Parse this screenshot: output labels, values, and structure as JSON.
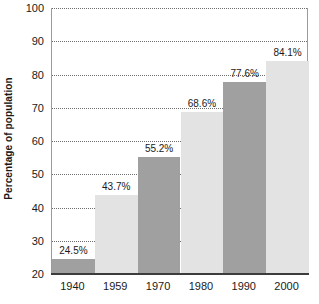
{
  "chart_data": {
    "type": "bar",
    "title": "",
    "subtitle": "",
    "xlabel": "",
    "ylabel": "Percentage of population",
    "categories": [
      "1940",
      "1959",
      "1970",
      "1980",
      "1990",
      "2000"
    ],
    "values": [
      24.5,
      43.7,
      55.2,
      68.6,
      77.6,
      84.1
    ],
    "data_labels": [
      "24.5%",
      "43.7%",
      "55.2%",
      "68.6%",
      "77.6%",
      "84.1%"
    ],
    "ylim": [
      20,
      100
    ],
    "ytick_labels": [
      "20",
      "30",
      "40",
      "50",
      "60",
      "70",
      "80",
      "90",
      "100"
    ],
    "ytick_values": [
      20,
      30,
      40,
      50,
      60,
      70,
      80,
      90,
      100
    ],
    "grid": true,
    "grid_style": "dotted",
    "legend": "none",
    "bar_colors": [
      "#a0a0a0",
      "#e3e3e3",
      "#a0a0a0",
      "#e3e3e3",
      "#a0a0a0",
      "#e3e3e3"
    ],
    "axis_color": "#3c3c3c",
    "gridline_color": "#6d6d6d",
    "text_color": "#1a1a1a",
    "background": "#ffffff"
  }
}
